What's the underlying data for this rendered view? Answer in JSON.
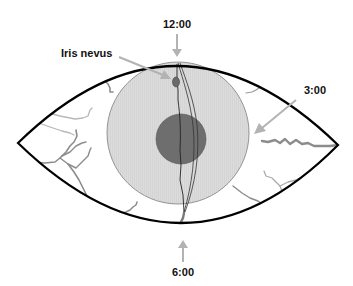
{
  "diagram": {
    "labels": {
      "top": "12:00",
      "right": "3:00",
      "bottom": "6:00",
      "nevus": "Iris nevus"
    },
    "colors": {
      "outline": "#000000",
      "iris_fill": "#d9d9d9",
      "iris_stroke": "#8a8a8a",
      "pupil_fill": "#6e6e6e",
      "nevus_fill": "#6a6a6a",
      "arrow": "#b3b3b3",
      "vessel_dark": "#8c8c8c",
      "vessel_light": "#b8b8b8",
      "text": "#111111"
    }
  }
}
